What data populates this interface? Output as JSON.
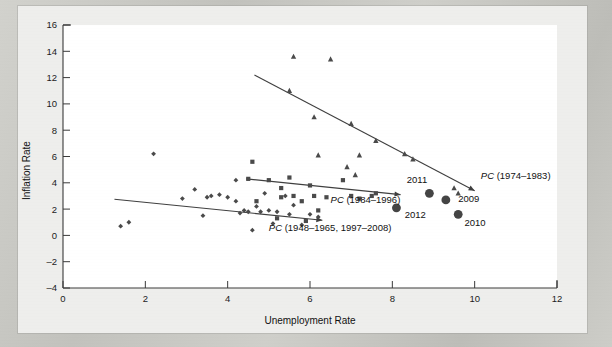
{
  "figure": {
    "background_color": "#eeeeec",
    "plot_background_color": "#ffffff",
    "border_color": "#c9c9c4"
  },
  "chart_data": {
    "type": "scatter",
    "title": "",
    "xlabel": "Unemployment Rate",
    "ylabel": "Inflation Rate",
    "xlim": [
      0,
      12
    ],
    "ylim": [
      -4,
      16
    ],
    "xticks": [
      0,
      2,
      4,
      6,
      8,
      10,
      12
    ],
    "yticks": [
      -4,
      -2,
      0,
      2,
      4,
      6,
      8,
      10,
      12,
      14,
      16
    ],
    "grid": false,
    "legend": "none",
    "marker_color": "#4a4a4a",
    "line_color": "#3f3f3f",
    "series": [
      {
        "name": "PC (1948-1965, 1997-2008)",
        "marker": "diamond",
        "points": [
          [
            1.4,
            0.7
          ],
          [
            1.6,
            1.0
          ],
          [
            2.2,
            6.2
          ],
          [
            2.9,
            2.8
          ],
          [
            3.2,
            3.5
          ],
          [
            3.5,
            2.9
          ],
          [
            3.6,
            3.0
          ],
          [
            3.8,
            3.1
          ],
          [
            4.2,
            4.2
          ],
          [
            4.2,
            2.6
          ],
          [
            4.3,
            1.7
          ],
          [
            4.4,
            1.9
          ],
          [
            4.5,
            1.8
          ],
          [
            4.6,
            0.4
          ],
          [
            4.8,
            1.8
          ],
          [
            5.0,
            1.9
          ],
          [
            5.2,
            1.8
          ],
          [
            4.0,
            2.9
          ],
          [
            3.4,
            1.5
          ],
          [
            4.9,
            3.2
          ],
          [
            5.6,
            2.3
          ],
          [
            5.5,
            1.6
          ],
          [
            6.0,
            1.6
          ],
          [
            5.8,
            0.8
          ],
          [
            6.2,
            1.4
          ],
          [
            5.1,
            0.9
          ],
          [
            4.7,
            2.2
          ],
          [
            5.4,
            3.0
          ]
        ]
      },
      {
        "name": "PC (1984-1996)",
        "marker": "square",
        "points": [
          [
            4.5,
            4.3
          ],
          [
            4.6,
            5.6
          ],
          [
            5.0,
            4.2
          ],
          [
            5.3,
            3.6
          ],
          [
            5.5,
            4.4
          ],
          [
            5.6,
            3.0
          ],
          [
            5.3,
            2.9
          ],
          [
            6.0,
            3.8
          ],
          [
            6.1,
            3.0
          ],
          [
            6.8,
            4.2
          ],
          [
            7.0,
            3.0
          ],
          [
            7.2,
            2.8
          ],
          [
            7.5,
            3.0
          ],
          [
            5.8,
            2.6
          ],
          [
            6.4,
            2.9
          ],
          [
            6.2,
            1.9
          ],
          [
            5.9,
            1.1
          ],
          [
            5.2,
            1.3
          ],
          [
            4.7,
            2.6
          ],
          [
            7.6,
            3.2
          ]
        ]
      },
      {
        "name": "PC (1974-1983)",
        "marker": "triangle",
        "points": [
          [
            5.5,
            11.0
          ],
          [
            5.6,
            13.6
          ],
          [
            6.5,
            13.4
          ],
          [
            6.1,
            9.0
          ],
          [
            7.0,
            8.5
          ],
          [
            7.2,
            6.1
          ],
          [
            7.6,
            7.2
          ],
          [
            8.3,
            6.2
          ],
          [
            8.5,
            5.8
          ],
          [
            9.5,
            3.6
          ],
          [
            6.9,
            5.2
          ],
          [
            6.2,
            6.1
          ],
          [
            7.1,
            4.6
          ],
          [
            9.6,
            3.2
          ]
        ]
      },
      {
        "name": "Recent years",
        "marker": "circle-large",
        "points": [
          {
            "x": 8.9,
            "y": 3.2,
            "label": "2011",
            "label_pos": "above-left"
          },
          {
            "x": 8.1,
            "y": 2.1,
            "label": "2012",
            "label_pos": "below-right"
          },
          {
            "x": 9.3,
            "y": 2.7,
            "label": "2009",
            "label_pos": "right"
          },
          {
            "x": 9.6,
            "y": 1.6,
            "label": "2010",
            "label_pos": "below-right"
          }
        ]
      }
    ],
    "trend_lines": [
      {
        "name": "PC (1974-1983)",
        "label": "PC (1974–1983)",
        "x1": 4.65,
        "y1": 12.2,
        "x2": 10.0,
        "y2": 3.4,
        "arrow": true
      },
      {
        "name": "PC (1984-1996)",
        "label": "PC (1984–1996)",
        "x1": 4.45,
        "y1": 4.3,
        "x2": 8.2,
        "y2": 3.1,
        "arrow": true
      },
      {
        "name": "PC (1948-1965, 1997-2008)",
        "label": "PC (1948–1965, 1997–2008)",
        "x1": 1.25,
        "y1": 2.75,
        "x2": 6.3,
        "y2": 1.15,
        "arrow": true
      }
    ],
    "annotations": [
      {
        "text": "PC (1974–1983)",
        "x": 10.15,
        "y": 4.3,
        "italic_prefix": "PC"
      },
      {
        "text": "PC (1984–1996)",
        "x": 6.5,
        "y": 2.45,
        "italic_prefix": "PC"
      },
      {
        "text": "PC (1948–1965, 1997–2008)",
        "x": 5.0,
        "y": 0.35,
        "italic_prefix": "PC"
      },
      {
        "text": "2011",
        "x": 8.35,
        "y": 3.95
      },
      {
        "text": "2012",
        "x": 8.3,
        "y": 1.35
      },
      {
        "text": "2009",
        "x": 9.6,
        "y": 2.55
      },
      {
        "text": "2010",
        "x": 9.75,
        "y": 0.7
      }
    ]
  }
}
